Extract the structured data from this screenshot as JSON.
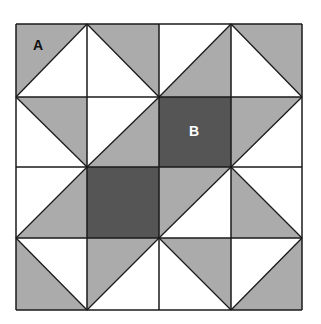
{
  "diagram": {
    "title": "",
    "grid": {
      "rows": 4,
      "cols": 4,
      "x": [
        16,
        87,
        159,
        231,
        302
      ],
      "y": [
        24,
        97,
        167,
        238,
        310
      ]
    },
    "colors": {
      "light_gray": "#ababab",
      "dark_gray": "#555555",
      "white": "#ffffff",
      "line": "#1a1a1a"
    },
    "cells": [
      [
        {
          "diag": "up",
          "a": "gray",
          "b": "white"
        },
        {
          "diag": "down",
          "a": "gray",
          "b": "white"
        },
        {
          "diag": "up",
          "a": "white",
          "b": "gray"
        },
        {
          "diag": "down",
          "a": "gray",
          "b": "white"
        }
      ],
      [
        {
          "diag": "down",
          "a": "gray",
          "b": "white"
        },
        {
          "diag": "up",
          "a": "white",
          "b": "gray"
        },
        {
          "solid": "dark"
        },
        {
          "diag": "up",
          "a": "gray",
          "b": "white"
        }
      ],
      [
        {
          "diag": "up",
          "a": "white",
          "b": "gray"
        },
        {
          "solid": "dark"
        },
        {
          "diag": "up",
          "a": "gray",
          "b": "white"
        },
        {
          "diag": "down",
          "a": "white",
          "b": "gray"
        }
      ],
      [
        {
          "diag": "down",
          "a": "white",
          "b": "gray"
        },
        {
          "diag": "up",
          "a": "gray",
          "b": "white"
        },
        {
          "diag": "down",
          "a": "gray",
          "b": "white"
        },
        {
          "diag": "up",
          "a": "white",
          "b": "gray"
        }
      ]
    ],
    "labels": [
      {
        "text": "A",
        "x": 38,
        "y": 50,
        "color": "#111111"
      },
      {
        "text": "B",
        "x": 194,
        "y": 136,
        "color": "#ffffff"
      }
    ]
  }
}
